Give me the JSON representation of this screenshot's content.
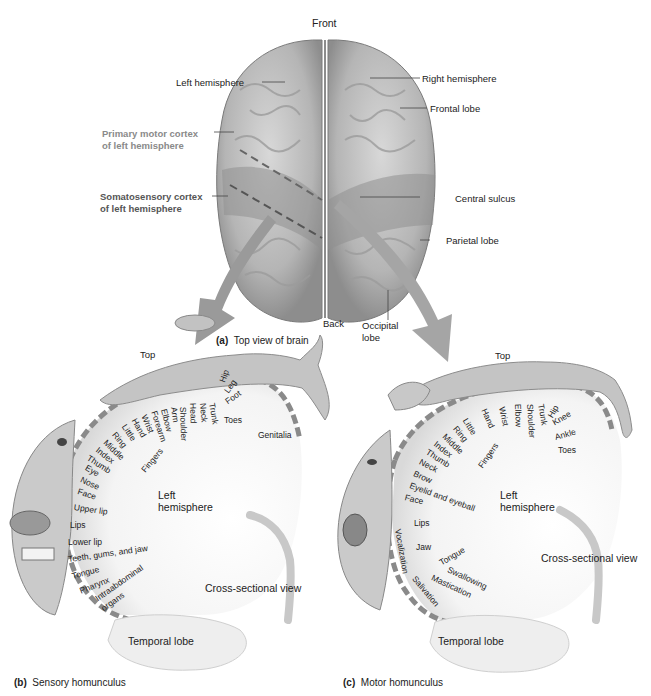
{
  "figure": {
    "panel_a": {
      "caption_letter": "(a)",
      "caption_text": "Top view of brain",
      "labels": {
        "front": "Front",
        "back": "Back",
        "left_hemisphere": "Left hemisphere",
        "right_hemisphere": "Right hemisphere",
        "frontal_lobe": "Frontal lobe",
        "primary_motor_line1": "Primary motor cortex",
        "primary_motor_line2": "of left hemisphere",
        "somatosensory_line1": "Somatosensory cortex",
        "somatosensory_line2": "of left hemisphere",
        "central_sulcus": "Central sulcus",
        "parietal_lobe": "Parietal lobe",
        "occipital_line1": "Occipital",
        "occipital_line2": "lobe"
      }
    },
    "panel_b": {
      "caption_letter": "(b)",
      "caption_text": "Sensory homunculus",
      "top": "Top",
      "left_hemisphere_line1": "Left",
      "left_hemisphere_line2": "hemisphere",
      "cross_section": "Cross-sectional view",
      "temporal_lobe": "Temporal lobe",
      "fingers": "Fingers",
      "body_parts": [
        "Genitalia",
        "Toes",
        "Foot",
        "Leg",
        "Hip",
        "Trunk",
        "Neck",
        "Head",
        "Shoulder",
        "Arm",
        "Elbow",
        "Forearm",
        "Wrist",
        "Hand",
        "Little",
        "Ring",
        "Middle",
        "Index",
        "Thumb",
        "Eye",
        "Nose",
        "Face",
        "Upper lip",
        "Lips",
        "Lower lip",
        "Teeth, gums, and jaw",
        "Tongue",
        "Pharynx",
        "Intraabdominal",
        "organs"
      ]
    },
    "panel_c": {
      "caption_letter": "(c)",
      "caption_text": "Motor homunculus",
      "top": "Top",
      "left_hemisphere_line1": "Left",
      "left_hemisphere_line2": "hemisphere",
      "cross_section": "Cross-sectional view",
      "temporal_lobe": "Temporal lobe",
      "fingers": "Fingers",
      "body_parts": [
        "Toes",
        "Ankle",
        "Knee",
        "Hip",
        "Trunk",
        "Shoulder",
        "Elbow",
        "Wrist",
        "Hand",
        "Little",
        "Ring",
        "Middle",
        "Index",
        "Thumb",
        "Neck",
        "Brow",
        "Eyelid and eyeball",
        "Face",
        "Lips",
        "Jaw",
        "Tongue",
        "Swallowing",
        "Mastication",
        "Salivation",
        "Vocalization"
      ]
    },
    "colors": {
      "brain": "#b9b9b9",
      "brain_shadow": "#8f8f8f",
      "arrow": "#9a9a9a",
      "cortex_band": "#8a8a8a",
      "homunculus": "#c4c4c4"
    }
  }
}
